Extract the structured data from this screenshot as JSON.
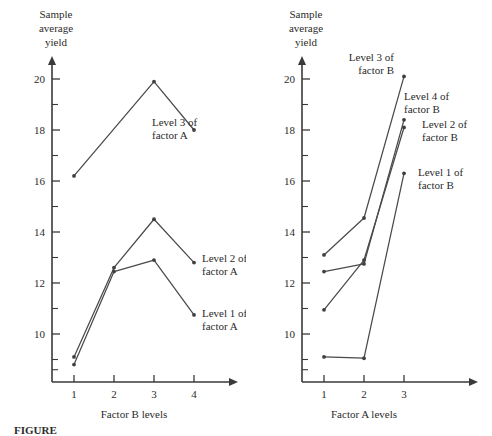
{
  "figure": {
    "caption": "FIGURE",
    "panels": [
      "left",
      "right"
    ]
  },
  "left_panel": {
    "y_axis_title_line1": "Sample",
    "y_axis_title_line2": "average",
    "y_axis_title_line3": "yield",
    "x_axis_title": "Factor B levels",
    "y_ticks": [
      "10",
      "12",
      "14",
      "16",
      "18",
      "20"
    ],
    "x_ticks": [
      "1",
      "2",
      "3",
      "4"
    ],
    "labels": [
      {
        "line1": "Level 3 of",
        "line2": "factor A"
      },
      {
        "line1": "Level 2 of",
        "line2": "factor A"
      },
      {
        "line1": "Level 1 of",
        "line2": "factor A"
      }
    ]
  },
  "right_panel": {
    "y_axis_title_line1": "Sample",
    "y_axis_title_line2": "average",
    "y_axis_title_line3": "yield",
    "x_axis_title": "Factor A levels",
    "y_ticks": [
      "10",
      "12",
      "14",
      "16",
      "18",
      "20"
    ],
    "x_ticks": [
      "1",
      "2",
      "3"
    ],
    "labels": [
      {
        "line1": "Level 3 of",
        "line2": "factor B"
      },
      {
        "line1": "Level 4 of",
        "line2": "factor B"
      },
      {
        "line1": "Level 2 of",
        "line2": "factor B"
      },
      {
        "line1": "Level 1 of",
        "line2": "factor B"
      }
    ]
  },
  "chart_data": [
    {
      "type": "line",
      "title": "",
      "xlabel": "Factor B levels",
      "ylabel": "Sample average yield",
      "categories": [
        1,
        2,
        3,
        4
      ],
      "xlim": [
        0.5,
        4.8
      ],
      "ylim": [
        8.2,
        20.6
      ],
      "yticks": [
        10,
        12,
        14,
        16,
        18,
        20
      ],
      "minor_yticks": [
        9,
        11,
        13,
        15,
        17,
        19
      ],
      "grid": false,
      "legend": "inline-right",
      "series": [
        {
          "name": "Level 3 of factor A",
          "x": [
            1,
            3,
            4
          ],
          "values": [
            16.2,
            19.9,
            18.0
          ]
        },
        {
          "name": "Level 2 of factor A",
          "x": [
            1,
            2,
            3,
            4
          ],
          "values": [
            9.1,
            12.6,
            14.5,
            12.8
          ]
        },
        {
          "name": "Level 1 of factor A",
          "x": [
            1,
            2,
            3,
            4
          ],
          "values": [
            8.8,
            12.45,
            12.9,
            10.75
          ]
        }
      ]
    },
    {
      "type": "line",
      "title": "",
      "xlabel": "Factor A levels",
      "ylabel": "Sample average yield",
      "categories": [
        1,
        2,
        3
      ],
      "xlim": [
        0.5,
        4.0
      ],
      "ylim": [
        8.2,
        20.6
      ],
      "yticks": [
        10,
        12,
        14,
        16,
        18,
        20
      ],
      "minor_yticks": [
        9,
        11,
        13,
        15,
        17,
        19
      ],
      "grid": false,
      "legend": "inline-right",
      "series": [
        {
          "name": "Level 3 of factor B",
          "x": [
            1,
            2,
            3
          ],
          "values": [
            13.1,
            14.55,
            20.1
          ]
        },
        {
          "name": "Level 4 of factor B",
          "x": [
            1,
            2,
            3
          ],
          "values": [
            12.45,
            12.75,
            18.4
          ]
        },
        {
          "name": "Level 2 of factor B",
          "x": [
            1,
            2,
            3
          ],
          "values": [
            10.95,
            12.9,
            18.1
          ]
        },
        {
          "name": "Level 1 of factor B",
          "x": [
            1,
            2,
            3
          ],
          "values": [
            9.1,
            9.05,
            16.3
          ]
        }
      ]
    }
  ]
}
